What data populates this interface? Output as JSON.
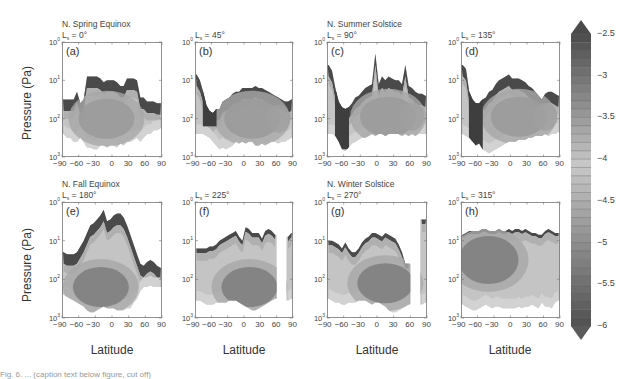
{
  "chart_data": {
    "type": "heatmap",
    "xlabel": "Latitude",
    "ylabel": "Pressure (Pa)",
    "x_ticks": [
      -90,
      -60,
      -30,
      0,
      30,
      60,
      90
    ],
    "x_tick_labels": [
      "−90",
      "−60",
      "−30",
      "0",
      "30",
      "60",
      "90"
    ],
    "y_scale": "log",
    "y_ticks": [
      "10^0",
      "10^1",
      "10^2",
      "10^3"
    ],
    "ylim": [
      1000,
      1
    ],
    "xlim": [
      -90,
      90
    ],
    "colorbar": {
      "min": -6,
      "max": -2.5,
      "extend": "both",
      "step": 0.1,
      "tick_labels": [
        "−2.5",
        "−3",
        "−3.5",
        "−4",
        "−4.5",
        "−5",
        "−5.5",
        "−6"
      ],
      "tick_values": [
        -2.5,
        -3,
        -3.5,
        -4,
        -4.5,
        -5,
        -5.5,
        -6
      ],
      "colormap": "grayscale (dark = high and low extremes, light = mid)"
    },
    "panels": [
      {
        "id": "a",
        "label": "(a)",
        "season": "N. Spring Equinox",
        "ls_value": "0°",
        "top_log_p": [
          1.5,
          1.5,
          1.5,
          1.5,
          1.3,
          1.6,
          1.5,
          0.9,
          0.9,
          0.9,
          0.9,
          0.95,
          1.05,
          1.0,
          1.0,
          1.0,
          1.05,
          1.15,
          1.15,
          0.95,
          0.95,
          0.95,
          1.0,
          1.45,
          1.45,
          1.55,
          1.55,
          1.55,
          1.6,
          1.6
        ],
        "bottom_log_p": [
          2.4,
          2.5,
          2.5,
          2.6,
          2.6,
          2.5,
          2.6,
          2.75,
          2.75,
          2.8,
          2.8,
          2.7,
          2.7,
          2.75,
          2.7,
          2.7,
          2.75,
          2.65,
          2.7,
          2.6,
          2.6,
          2.55,
          2.5,
          2.6,
          2.5,
          2.4,
          2.4,
          2.3,
          2.3,
          2.25
        ],
        "core_center": [
          -10,
          2.0
        ]
      },
      {
        "id": "b",
        "label": "(b)",
        "season": "",
        "ls_value": "45°",
        "top_log_p": [
          0.85,
          1.0,
          1.3,
          1.65,
          1.8,
          1.85,
          1.75,
          1.75,
          1.55,
          1.5,
          1.45,
          1.35,
          1.3,
          1.3,
          1.2,
          1.2,
          1.2,
          1.2,
          1.15,
          1.2,
          1.2,
          1.25,
          1.3,
          1.35,
          1.4,
          1.45,
          1.5,
          1.55,
          1.55,
          1.5
        ],
        "bottom_log_p": [
          2.4,
          2.4,
          2.4,
          2.45,
          2.5,
          2.6,
          2.7,
          2.8,
          2.75,
          2.8,
          2.75,
          2.7,
          2.6,
          2.65,
          2.6,
          2.65,
          2.6,
          2.6,
          2.7,
          2.7,
          2.65,
          2.7,
          2.65,
          2.6,
          2.6,
          2.65,
          2.6,
          2.6,
          2.55,
          2.5
        ],
        "core_center": [
          15,
          2.0
        ]
      },
      {
        "id": "c",
        "label": "(c)",
        "season": "N. Summer Solstice",
        "ls_value": "90°",
        "top_log_p": [
          0.6,
          0.75,
          1.2,
          1.55,
          1.7,
          1.75,
          1.7,
          1.6,
          1.45,
          1.4,
          1.3,
          1.2,
          1.15,
          1.1,
          0.3,
          1.1,
          0.9,
          1.0,
          0.9,
          0.95,
          1.0,
          1.0,
          1.1,
          0.6,
          1.15,
          1.2,
          1.3,
          1.35,
          1.35,
          1.4
        ],
        "bottom_log_p": [
          2.4,
          2.4,
          2.45,
          2.6,
          2.8,
          2.85,
          2.75,
          2.65,
          2.6,
          2.55,
          2.5,
          2.5,
          2.45,
          2.4,
          2.45,
          2.4,
          2.4,
          2.45,
          2.4,
          2.4,
          2.4,
          2.4,
          2.45,
          2.4,
          2.45,
          2.4,
          2.45,
          2.4,
          2.4,
          2.4
        ],
        "core_center": [
          20,
          1.95
        ]
      },
      {
        "id": "d",
        "label": "(d)",
        "season": "",
        "ls_value": "135°",
        "top_log_p": [
          0.6,
          0.7,
          1.3,
          1.5,
          1.6,
          1.6,
          1.5,
          1.45,
          1.3,
          1.25,
          1.1,
          1.0,
          0.95,
          0.9,
          0.85,
          0.95,
          0.95,
          0.95,
          1.0,
          1.05,
          1.15,
          1.2,
          1.3,
          1.4,
          1.5,
          1.35,
          1.3,
          1.3,
          1.35,
          1.4
        ],
        "bottom_log_p": [
          2.4,
          2.45,
          2.5,
          2.6,
          2.7,
          2.65,
          2.8,
          2.85,
          2.9,
          2.85,
          2.8,
          2.75,
          2.7,
          2.65,
          2.6,
          2.6,
          2.6,
          2.55,
          2.55,
          2.55,
          2.5,
          2.5,
          2.45,
          2.45,
          2.45,
          2.4,
          2.45,
          2.4,
          2.4,
          2.35
        ],
        "core_center": [
          15,
          1.95
        ]
      },
      {
        "id": "e",
        "label": "(e)",
        "season": "N. Fall Equinox",
        "ls_value": "180°",
        "top_log_p": [
          1.3,
          1.35,
          1.35,
          1.35,
          1.3,
          1.15,
          1.0,
          0.8,
          0.6,
          0.55,
          0.45,
          0.35,
          0.2,
          0.5,
          0.45,
          0.35,
          0.3,
          0.3,
          0.4,
          0.6,
          0.85,
          1.1,
          1.35,
          1.6,
          1.65,
          1.55,
          1.5,
          1.55,
          1.65,
          1.7
        ],
        "bottom_log_p": [
          2.4,
          2.45,
          2.5,
          2.55,
          2.6,
          2.65,
          2.7,
          2.8,
          2.85,
          2.85,
          2.8,
          2.75,
          2.7,
          2.75,
          2.75,
          2.75,
          2.8,
          2.8,
          2.8,
          2.75,
          2.75,
          2.6,
          2.5,
          2.3,
          2.2,
          2.2,
          2.15,
          2.2,
          2.2,
          2.2
        ],
        "core_center": [
          -20,
          2.2
        ]
      },
      {
        "id": "f",
        "label": "(f)",
        "season": "",
        "ls_value": "225°",
        "top_log_p": [
          1.2,
          1.2,
          1.2,
          1.2,
          1.15,
          1.15,
          1.1,
          1.0,
          0.95,
          0.9,
          0.85,
          0.8,
          0.75,
          0.9,
          1.0,
          0.65,
          0.7,
          0.8,
          0.8,
          0.8,
          0.95,
          0.75,
          0.7,
          0.75,
          0.85,
          null,
          null,
          null,
          0.9,
          0.8
        ],
        "bottom_log_p": [
          2.55,
          2.55,
          2.6,
          2.65,
          2.65,
          2.65,
          2.6,
          2.6,
          2.6,
          2.6,
          2.55,
          2.55,
          2.55,
          2.6,
          2.65,
          2.7,
          2.75,
          2.8,
          2.8,
          2.75,
          2.7,
          2.65,
          2.6,
          2.55,
          2.5,
          null,
          null,
          null,
          2.55,
          2.5
        ],
        "core_center": [
          10,
          2.2
        ]
      },
      {
        "id": "g",
        "label": "(g)",
        "season": "N. Winter Solstice",
        "ls_value": "270°",
        "top_log_p": [
          1.0,
          1.0,
          1.05,
          1.1,
          1.2,
          1.05,
          1.2,
          1.3,
          1.3,
          1.2,
          1.05,
          0.95,
          0.9,
          0.8,
          0.8,
          0.85,
          0.9,
          0.8,
          0.85,
          0.9,
          0.95,
          1.1,
          1.3,
          1.6,
          1.6,
          null,
          null,
          null,
          0.45,
          0.45
        ],
        "bottom_log_p": [
          2.5,
          2.55,
          2.6,
          2.6,
          2.65,
          2.65,
          2.6,
          2.6,
          2.6,
          2.55,
          2.55,
          2.55,
          2.6,
          2.65,
          2.6,
          2.6,
          2.65,
          2.7,
          2.8,
          2.85,
          2.85,
          2.8,
          2.75,
          2.7,
          2.65,
          null,
          null,
          null,
          2.65,
          2.6
        ],
        "core_center": [
          15,
          2.1
        ]
      },
      {
        "id": "h",
        "label": "(h)",
        "season": "",
        "ls_value": "315°",
        "top_log_p": [
          0.85,
          0.8,
          0.75,
          0.75,
          0.75,
          0.75,
          0.7,
          0.7,
          0.75,
          0.75,
          0.75,
          0.7,
          0.75,
          0.75,
          0.7,
          0.75,
          0.7,
          0.7,
          0.75,
          0.7,
          0.75,
          0.8,
          0.8,
          0.85,
          0.85,
          0.75,
          0.7,
          0.75,
          0.8,
          0.8
        ],
        "bottom_log_p": [
          2.65,
          2.7,
          2.75,
          2.8,
          2.8,
          2.75,
          2.7,
          2.65,
          2.7,
          2.75,
          2.7,
          2.7,
          2.75,
          2.75,
          2.75,
          2.75,
          2.75,
          2.7,
          2.75,
          2.7,
          2.7,
          2.65,
          2.7,
          2.75,
          2.6,
          2.7,
          2.7,
          2.75,
          2.6,
          2.55
        ],
        "core_center": [
          -40,
          1.5
        ]
      }
    ]
  },
  "labels": {
    "ylabel_top": "Pressure (Pa)",
    "ylabel_bottom": "Pressure (Pa)",
    "xlabel": "Latitude",
    "y_tick_base": "10",
    "y_tick_exps": [
      "0",
      "1",
      "2",
      "3"
    ],
    "x_ticks_text": "−90 −60 −30  0   30  60  90",
    "ls_prefix": "L",
    "ls_sub": "s",
    "ls_eq": " = "
  },
  "caption_fragment": "Fig. 6. ... (caption text below figure, cut off)"
}
